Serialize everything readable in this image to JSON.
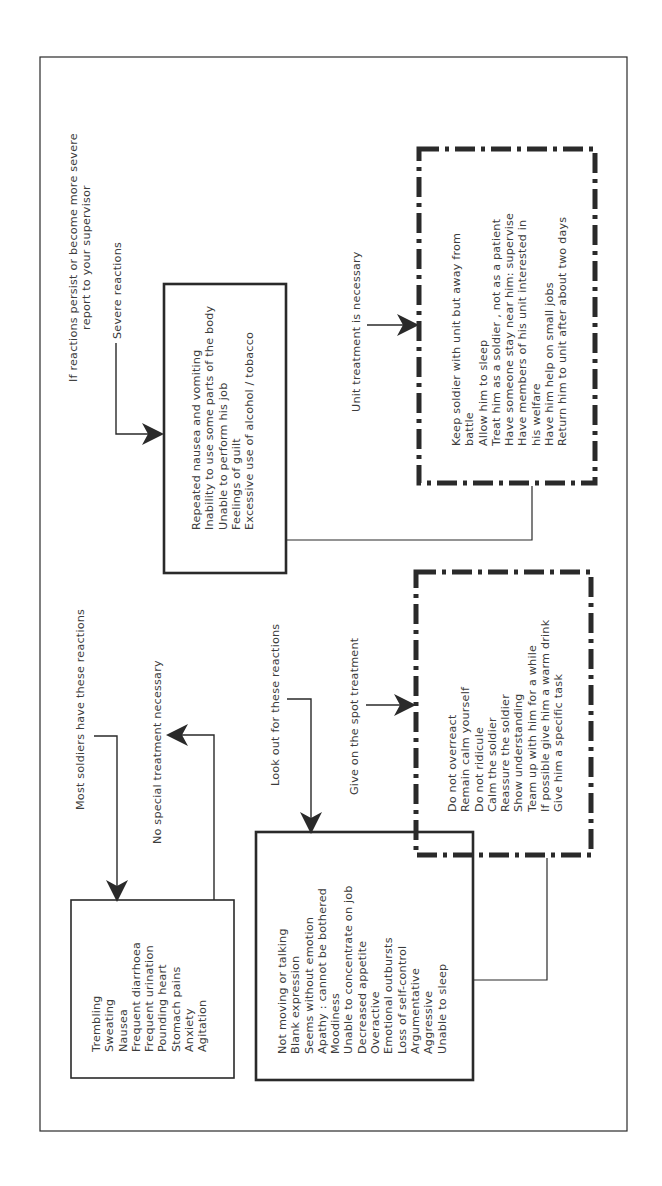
{
  "diagram": {
    "orientation": "rotated -90deg (reads bottom-to-top)",
    "colors": {
      "ink": "#2a2a2a",
      "text": "#3c3c3c",
      "background": "#ffffff"
    },
    "mild": {
      "intro": "Most soldiers have these reactions",
      "outcome": "No special treatment necessary",
      "items": [
        "Trembling",
        "Sweating",
        "Nausea",
        "Frequent diarrhoea",
        "Frequent urination",
        "Pounding heart",
        "Stomach pains",
        "Anxiety",
        "Agitation"
      ]
    },
    "moderate": {
      "intro": "Look out for these reactions",
      "items": [
        "Not moving or talking",
        "Blank expression",
        "Seems without emotion",
        "Apathy : cannot be bothered",
        "Moodiness",
        "Unable to concentrate on job",
        "Decreased appetite",
        "Overactive",
        "Emotional outbursts",
        "Loss of self-control",
        "Argumentative",
        "Aggressive",
        "Unable to sleep"
      ],
      "treatment_label": "Give on the spot treatment",
      "treatment_items": [
        "Do not overreact",
        "Remain calm yourself",
        "Do not ridicule",
        "Calm the soldier",
        "Reassure the soldier",
        "Show understanding",
        "Team up with him for a while",
        "If possible give him a warm drink",
        "Give him a specific task"
      ]
    },
    "severe": {
      "escalation_line1": "If reactions persist or become more severe",
      "escalation_line2": "report to your supervisor",
      "intro": "Severe reactions",
      "items": [
        "Repeated nausea and vomiting",
        "Inability to use some parts of the body",
        "Unable to perform his job",
        "Feelings of guilt",
        "Excessive use of alcohol / tobacco"
      ],
      "treatment_label": "Unit treatment is necessary",
      "treatment_items": [
        "Keep soldier with unit but away from",
        "battle",
        "Allow him to sleep",
        "Treat him as a soldier ,  not as a patient",
        "Have someone stay near him:  supervise",
        "Have members of his unit interested in",
        "his welfare",
        "Have him help on small jobs",
        "Return him to unit after about two days"
      ]
    }
  }
}
